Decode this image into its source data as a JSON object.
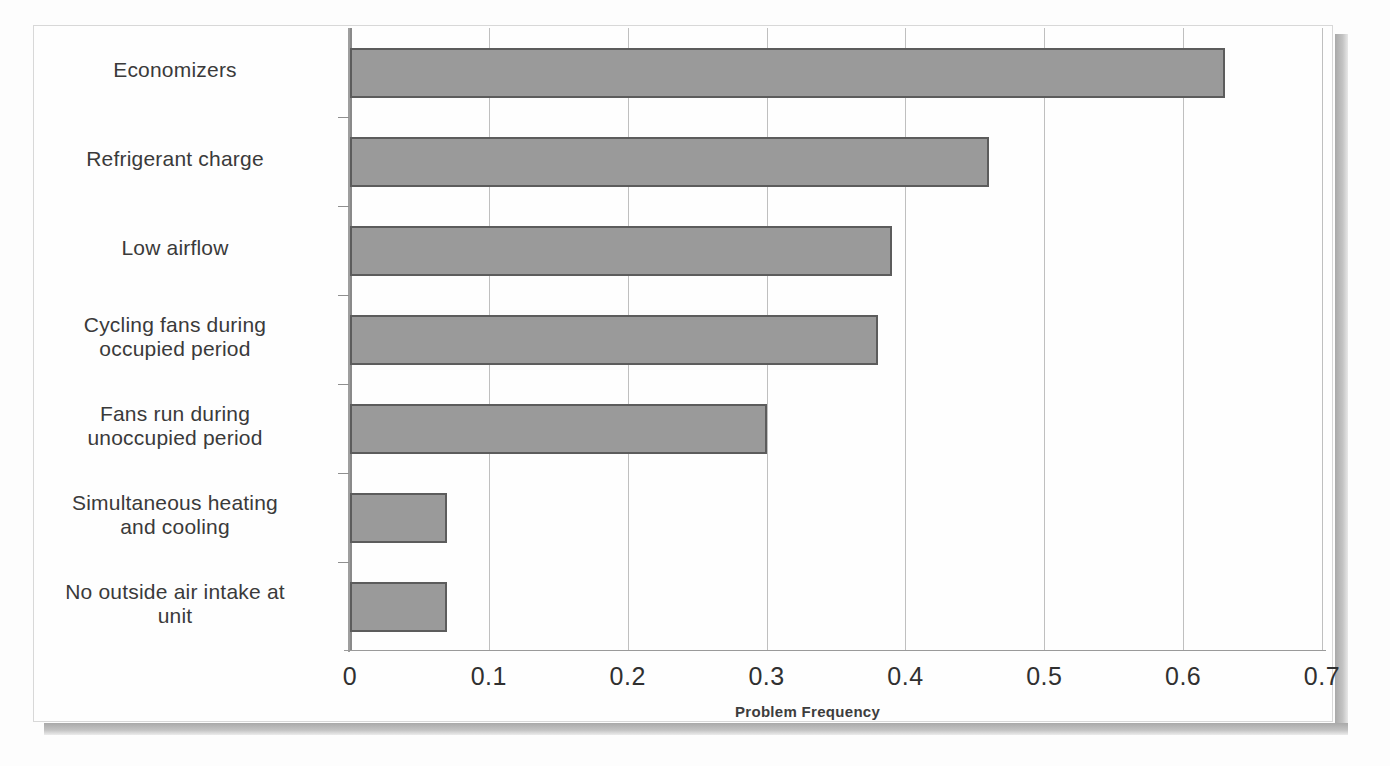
{
  "chart_data": {
    "type": "bar",
    "orientation": "horizontal",
    "title": "",
    "xlabel": "Problem Frequency",
    "ylabel": "",
    "xlim": [
      0,
      0.7
    ],
    "grid": true,
    "legend": false,
    "categories": [
      "Economizers",
      "Refrigerant charge",
      "Low airflow",
      "Cycling fans during\noccupied period",
      "Fans run during\nunoccupied period",
      "Simultaneous heating\nand cooling",
      "No outside air intake at\nunit"
    ],
    "values": [
      0.63,
      0.46,
      0.39,
      0.38,
      0.3,
      0.07,
      0.07
    ],
    "xticks": [
      "0",
      "0.1",
      "0.2",
      "0.3",
      "0.4",
      "0.5",
      "0.6",
      "0.7"
    ],
    "xtick_values": [
      0,
      0.1,
      0.2,
      0.3,
      0.4,
      0.5,
      0.6,
      0.7
    ],
    "bar_fill_color": "#9a9a9a",
    "bar_border_color": "#5c5c5c",
    "gridline_color": "#bfbfbf",
    "axis_color": "#8a8a8a",
    "text_color": "#3a3a3a"
  }
}
